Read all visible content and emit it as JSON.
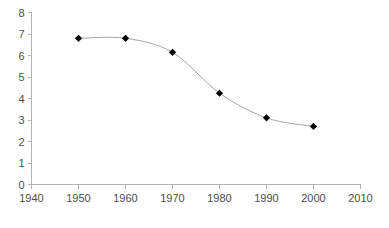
{
  "chart_data": {
    "type": "line",
    "title": "",
    "subtitle": "",
    "xlabel": "",
    "ylabel": "",
    "x": [
      1950,
      1960,
      1970,
      1980,
      1990,
      2000
    ],
    "values": [
      6.8,
      6.8,
      6.15,
      4.25,
      3.1,
      2.7
    ],
    "series": [
      {
        "name": "",
        "x": [
          1950,
          1960,
          1970,
          1980,
          1990,
          2000
        ],
        "values": [
          6.8,
          6.8,
          6.15,
          4.25,
          3.1,
          2.7
        ]
      }
    ],
    "xlim": [
      1940,
      2010
    ],
    "ylim": [
      0,
      8
    ],
    "x_ticks": [
      1940,
      1950,
      1960,
      1970,
      1980,
      1990,
      2000,
      2010
    ],
    "y_ticks": [
      0,
      1,
      2,
      3,
      4,
      5,
      6,
      7,
      8
    ],
    "x_tick_labels": [
      "1940",
      "1950",
      "1960",
      "1970",
      "1980",
      "1990",
      "2000",
      "2010"
    ],
    "y_tick_labels": [
      "0",
      "1",
      "2",
      "3",
      "4",
      "5",
      "6",
      "7",
      "8"
    ],
    "grid": false,
    "legend": false,
    "legend_position": "none",
    "smoothed": true,
    "marker": "diamond",
    "annotations": [],
    "colors": {
      "line": "#a6a6a6",
      "marker": "#000000",
      "axis": "#b3b3b3",
      "tick_text": "#4d4d4d",
      "background": "#ffffff"
    }
  }
}
